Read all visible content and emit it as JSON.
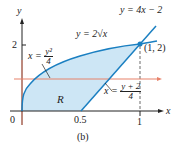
{
  "figure": {
    "caption": "(b)",
    "axes": {
      "x_label": "x",
      "y_label": "y",
      "x_ticks": [
        "0",
        "0.5",
        "1"
      ],
      "y_ticks": [
        "2"
      ]
    },
    "curves": {
      "sqrt": "y = 2√x",
      "line": "y = 4x − 2",
      "left_bound": {
        "lhs": "x =",
        "num": "y²",
        "den": "4"
      },
      "right_bound": {
        "lhs": "x =",
        "num": "y + 2",
        "den": "4"
      }
    },
    "intersection_point": "(1, 2)",
    "region_label": "R",
    "colors": {
      "curve": "#1a7fc1",
      "fill": "#cde6f5",
      "horizontal_line": "#e8826a",
      "axis": "#222222"
    }
  }
}
